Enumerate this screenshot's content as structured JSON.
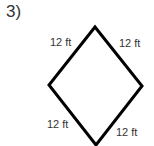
{
  "problem": {
    "number_label": "3)"
  },
  "shape": {
    "type": "rhombus",
    "stroke_color": "#000000",
    "vertices": {
      "top": [
        95,
        27
      ],
      "right": [
        142,
        86
      ],
      "bottom": [
        96,
        145
      ],
      "left": [
        49,
        85
      ]
    }
  },
  "labels": {
    "top_left": "12 ft",
    "top_right": "12 ft",
    "bottom_left": "12 ft",
    "bottom_right": "12 ft"
  }
}
